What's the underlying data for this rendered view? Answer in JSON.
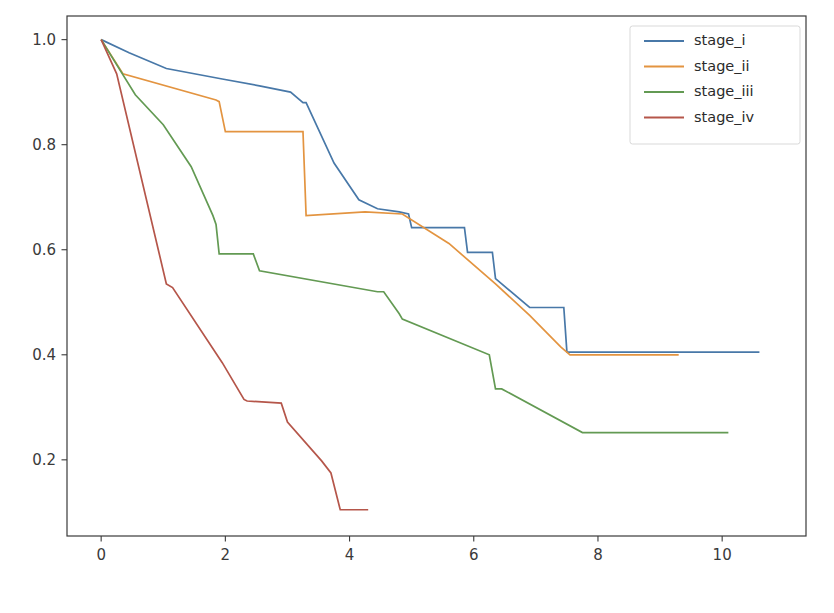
{
  "chart_data": {
    "type": "line",
    "title": "",
    "xlabel": "",
    "ylabel": "",
    "xlim": [
      -0.55,
      11.35
    ],
    "ylim": [
      0.055,
      1.045
    ],
    "grid": false,
    "legend_position": "upper right",
    "xticks": [
      0,
      2,
      4,
      6,
      8,
      10
    ],
    "xtick_labels": [
      "0",
      "2",
      "4",
      "6",
      "8",
      "10"
    ],
    "yticks": [
      0.2,
      0.4,
      0.6,
      0.8,
      1.0
    ],
    "ytick_labels": [
      "0.2",
      "0.4",
      "0.6",
      "0.8",
      "1.0"
    ],
    "series": [
      {
        "name": "stage_i",
        "color": "#4878a8",
        "x": [
          0.0,
          0.45,
          1.05,
          1.95,
          2.55,
          3.05,
          3.25,
          3.3,
          3.75,
          4.15,
          4.45,
          4.8,
          4.95,
          5.0,
          5.85,
          5.9,
          6.3,
          6.35,
          6.9,
          6.95,
          7.45,
          7.5,
          10.6
        ],
        "y": [
          1.0,
          0.975,
          0.945,
          0.925,
          0.912,
          0.9,
          0.88,
          0.88,
          0.765,
          0.695,
          0.678,
          0.672,
          0.668,
          0.642,
          0.642,
          0.595,
          0.595,
          0.545,
          0.49,
          0.49,
          0.49,
          0.405,
          0.405
        ]
      },
      {
        "name": "stage_ii",
        "color": "#e39440",
        "x": [
          0.0,
          0.35,
          1.85,
          1.9,
          2.0,
          3.25,
          3.3,
          4.25,
          4.85,
          5.6,
          6.35,
          6.9,
          7.4,
          7.55,
          9.3
        ],
        "y": [
          1.0,
          0.935,
          0.885,
          0.882,
          0.825,
          0.825,
          0.665,
          0.672,
          0.668,
          0.612,
          0.535,
          0.475,
          0.415,
          0.4,
          0.4
        ]
      },
      {
        "name": "stage_iii",
        "color": "#639a53"
      },
      {
        "name": "stage_iv",
        "color": "#b5564a"
      }
    ],
    "series_stage_iii": {
      "name": "stage_iii",
      "color": "#639a53",
      "x": [
        0.0,
        0.55,
        1.0,
        1.45,
        1.8,
        1.85,
        1.9,
        2.45,
        2.55,
        4.45,
        4.55,
        4.8,
        4.85,
        6.25,
        6.35,
        6.45,
        7.75,
        7.85,
        10.1
      ],
      "y": [
        1.0,
        0.895,
        0.838,
        0.758,
        0.665,
        0.648,
        0.592,
        0.592,
        0.56,
        0.52,
        0.52,
        0.478,
        0.468,
        0.4,
        0.335,
        0.335,
        0.252,
        0.252,
        0.252
      ]
    },
    "series_stage_iv": {
      "name": "stage_iv",
      "color": "#b5564a",
      "x": [
        0.0,
        0.25,
        1.05,
        1.15,
        1.95,
        2.3,
        2.35,
        2.9,
        3.0,
        3.55,
        3.7,
        3.85,
        4.3
      ],
      "y": [
        1.0,
        0.935,
        0.535,
        0.528,
        0.385,
        0.315,
        0.312,
        0.308,
        0.272,
        0.198,
        0.175,
        0.105,
        0.105
      ]
    }
  },
  "legend": {
    "entries": [
      {
        "label": "stage_i",
        "color": "#4878a8"
      },
      {
        "label": "stage_ii",
        "color": "#e39440"
      },
      {
        "label": "stage_iii",
        "color": "#639a53"
      },
      {
        "label": "stage_iv",
        "color": "#b5564a"
      }
    ]
  },
  "axes": {
    "frame_color": "#3a3a3a",
    "background": "#ffffff"
  }
}
